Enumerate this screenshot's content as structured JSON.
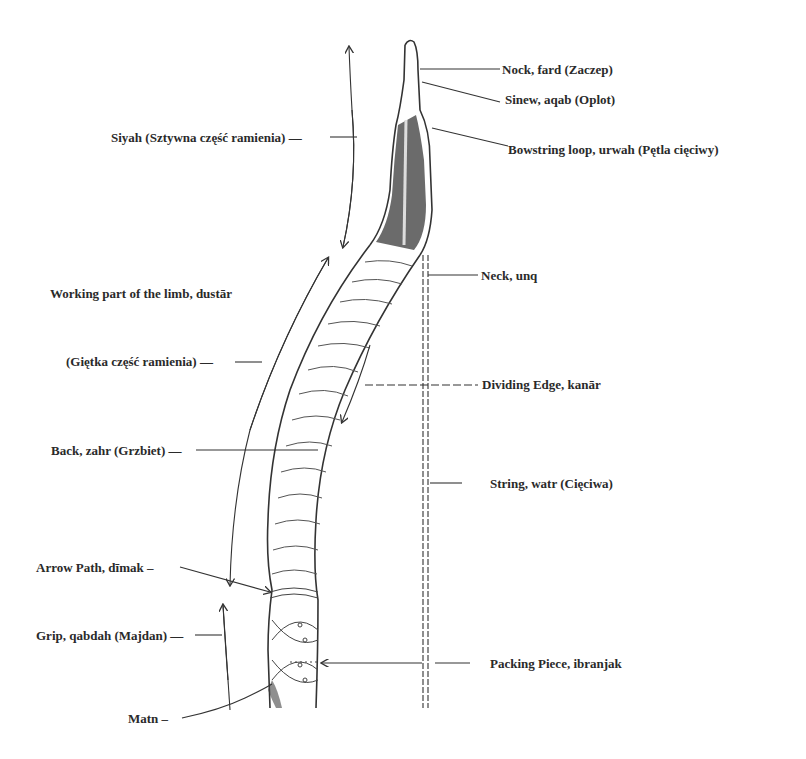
{
  "diagram": {
    "labels": {
      "nock": "Nock, fard (Zaczep)",
      "sinew": "Sinew, aqab (Oplot)",
      "bowstring_loop": "Bowstring loop, urwah (Pętla cięciwy)",
      "siyah": "Siyah (Sztywna część ramienia) —",
      "working_part": "Working part of the limb, dustār",
      "gietka": "(Giętka część ramienia) —",
      "neck": "Neck, unq",
      "dividing_edge": "Dividing Edge, kanār",
      "back": "Back, zahr (Grzbiet) —",
      "string": "String, watr (Cięciwa)",
      "arrow_path": "Arrow Path, dīmak –",
      "grip": "Grip, qabdah (Majdan) —",
      "packing_piece": "Packing Piece, ibranjak",
      "matn": "Matn –"
    },
    "colors": {
      "ink": "#2a2a2a",
      "background": "#ffffff"
    }
  }
}
